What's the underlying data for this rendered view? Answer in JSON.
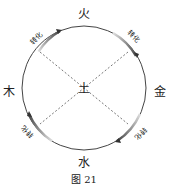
{
  "diagram": {
    "elements": {
      "top": "火",
      "right": "金",
      "bottom": "水",
      "left": "木",
      "center": "土"
    },
    "transform_label": "转化",
    "caption": "图 21",
    "colors": {
      "circle": "#444444",
      "dashed": "#555555",
      "gradient_dark": "#444444",
      "gradient_light": "#dddddd"
    }
  }
}
